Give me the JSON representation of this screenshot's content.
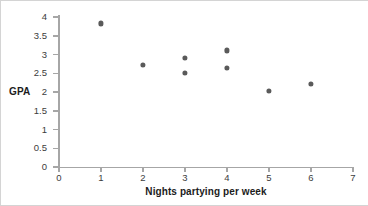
{
  "chart_data": {
    "type": "scatter",
    "title": "",
    "xlabel": "Nights partying per week",
    "ylabel": "GPA",
    "xlim": [
      0,
      7
    ],
    "ylim": [
      0,
      4
    ],
    "grid": false,
    "legend": null,
    "xticks": [
      "0",
      "1",
      "2",
      "3",
      "4",
      "5",
      "6",
      "7"
    ],
    "yticks": [
      "0",
      "0.5",
      "1",
      "1.5",
      "2",
      "2.5",
      "3",
      "3.5",
      "4"
    ],
    "marker_color": "#5a5a5a",
    "axis_color": "#a6a6a6",
    "points": [
      {
        "x": 1,
        "y": 3.83
      },
      {
        "x": 2,
        "y": 2.72
      },
      {
        "x": 3,
        "y": 2.92
      },
      {
        "x": 3,
        "y": 2.51
      },
      {
        "x": 4,
        "y": 3.11
      },
      {
        "x": 4,
        "y": 2.64
      },
      {
        "x": 5,
        "y": 2.02
      },
      {
        "x": 6,
        "y": 2.21
      }
    ]
  }
}
